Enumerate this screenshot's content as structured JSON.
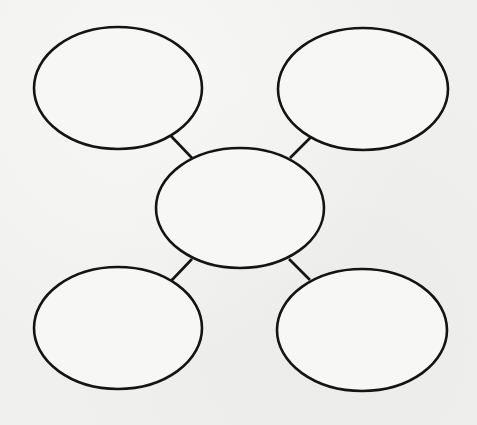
{
  "diagram": {
    "type": "bubble-web-graphic-organizer",
    "background_color": "#f0f0ee",
    "stroke_color": "#141414",
    "nodes": [
      {
        "id": "center",
        "label": "",
        "cx": 240,
        "cy": 208,
        "rx": 84,
        "ry": 60
      },
      {
        "id": "top-left",
        "label": "",
        "cx": 118,
        "cy": 88,
        "rx": 84,
        "ry": 61
      },
      {
        "id": "top-right",
        "label": "",
        "cx": 363,
        "cy": 89,
        "rx": 85,
        "ry": 61
      },
      {
        "id": "bottom-left",
        "label": "",
        "cx": 118,
        "cy": 328,
        "rx": 84,
        "ry": 61
      },
      {
        "id": "bottom-right",
        "label": "",
        "cx": 362,
        "cy": 330,
        "rx": 85,
        "ry": 61
      }
    ],
    "edges": [
      {
        "from": "center",
        "to": "top-left",
        "x1": 192,
        "y1": 158,
        "x2": 171,
        "y2": 136
      },
      {
        "from": "center",
        "to": "top-right",
        "x1": 290,
        "y1": 158,
        "x2": 311,
        "y2": 137
      },
      {
        "from": "center",
        "to": "bottom-left",
        "x1": 192,
        "y1": 259,
        "x2": 171,
        "y2": 281
      },
      {
        "from": "center",
        "to": "bottom-right",
        "x1": 289,
        "y1": 259,
        "x2": 310,
        "y2": 280
      }
    ]
  }
}
